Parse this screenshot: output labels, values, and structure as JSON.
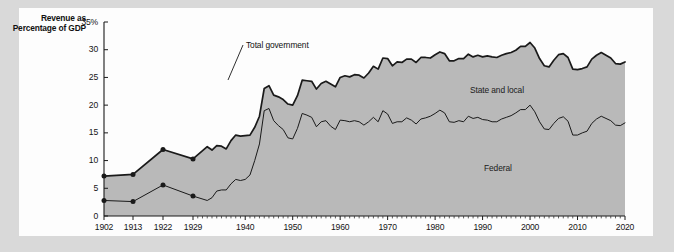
{
  "figure": {
    "panel_bg": "#fdfdfd",
    "outer_bg": "#d9d9d9",
    "area_fill": "#b9b9b9",
    "line_color": "#1a1a1a"
  },
  "axis_title": "Revenue as Percentage of GDP",
  "labels": {
    "total_government": "Total government",
    "state_and_local": "State and local",
    "federal": "Federal"
  },
  "chart_data": {
    "type": "area",
    "title": "Revenue as Percentage of GDP",
    "xlabel": "",
    "ylabel": "Revenue as Percentage of GDP",
    "ylim": [
      0,
      35
    ],
    "xlim": [
      1902,
      2020
    ],
    "grid": false,
    "legend": "inline-annotations",
    "ytick_labels": [
      "0",
      "5",
      "10",
      "15",
      "20",
      "25",
      "30",
      "35%"
    ],
    "ytick_values": [
      0,
      5,
      10,
      15,
      20,
      25,
      30,
      35
    ],
    "xtick_labels": [
      "1902",
      "1913",
      "1922",
      "1929",
      "1940",
      "1950",
      "1960",
      "1970",
      "1980",
      "1990",
      "2000",
      "2010",
      "2020"
    ],
    "xtick_values": [
      1902,
      1913,
      1922,
      1929,
      1940,
      1950,
      1960,
      1970,
      1980,
      1990,
      2000,
      2010,
      2020
    ],
    "annotations": [
      {
        "text": "Total government",
        "x": 1948,
        "y": 32.5
      },
      {
        "text": "State and local",
        "x": 1984,
        "y": 25.0
      },
      {
        "text": "Federal",
        "x": 1986,
        "y": 9.0
      }
    ],
    "marker_years": [
      1902,
      1913,
      1922,
      1929
    ],
    "series": [
      {
        "name": "Federal",
        "stacked": "bottom",
        "x": [
          1902,
          1913,
          1922,
          1929,
          1932,
          1933,
          1934,
          1935,
          1936,
          1937,
          1938,
          1939,
          1940,
          1941,
          1942,
          1943,
          1944,
          1945,
          1946,
          1947,
          1948,
          1949,
          1950,
          1951,
          1952,
          1953,
          1954,
          1955,
          1956,
          1957,
          1958,
          1959,
          1960,
          1961,
          1962,
          1963,
          1964,
          1965,
          1966,
          1967,
          1968,
          1969,
          1970,
          1971,
          1972,
          1973,
          1974,
          1975,
          1976,
          1977,
          1978,
          1979,
          1980,
          1981,
          1982,
          1983,
          1984,
          1985,
          1986,
          1987,
          1988,
          1989,
          1990,
          1991,
          1992,
          1993,
          1994,
          1995,
          1996,
          1997,
          1998,
          1999,
          2000,
          2001,
          2002,
          2003,
          2004,
          2005,
          2006,
          2007,
          2008,
          2009,
          2010,
          2011,
          2012,
          2013,
          2014,
          2015,
          2016,
          2017,
          2018,
          2019,
          2020
        ],
        "values": [
          2.8,
          2.6,
          5.6,
          3.6,
          2.8,
          3.3,
          4.5,
          4.7,
          4.7,
          5.8,
          6.6,
          6.4,
          6.6,
          7.4,
          10.0,
          13.0,
          19.0,
          19.4,
          17.2,
          16.3,
          15.6,
          14.1,
          13.9,
          15.8,
          18.5,
          18.2,
          17.8,
          16.1,
          17.0,
          17.2,
          16.2,
          15.6,
          17.3,
          17.2,
          17.0,
          17.2,
          17.0,
          16.4,
          17.0,
          17.8,
          17.0,
          19.0,
          18.4,
          16.7,
          17.0,
          17.0,
          17.7,
          17.3,
          16.6,
          17.5,
          17.7,
          18.0,
          18.5,
          19.1,
          18.6,
          17.0,
          16.9,
          17.2,
          17.0,
          18.0,
          17.6,
          17.8,
          17.4,
          17.3,
          17.0,
          17.0,
          17.5,
          17.8,
          18.1,
          18.6,
          19.2,
          19.2,
          20.0,
          18.8,
          17.0,
          15.7,
          15.6,
          16.7,
          17.6,
          17.9,
          17.1,
          14.6,
          14.6,
          15.0,
          15.3,
          16.7,
          17.5,
          18.0,
          17.6,
          17.2,
          16.4,
          16.3,
          16.8
        ]
      },
      {
        "name": "State and local",
        "stacked": "top",
        "x": [
          1902,
          1913,
          1922,
          1929,
          1932,
          1933,
          1934,
          1935,
          1936,
          1937,
          1938,
          1939,
          1940,
          1941,
          1942,
          1943,
          1944,
          1945,
          1946,
          1947,
          1948,
          1949,
          1950,
          1951,
          1952,
          1953,
          1954,
          1955,
          1956,
          1957,
          1958,
          1959,
          1960,
          1961,
          1962,
          1963,
          1964,
          1965,
          1966,
          1967,
          1968,
          1969,
          1970,
          1971,
          1972,
          1973,
          1974,
          1975,
          1976,
          1977,
          1978,
          1979,
          1980,
          1981,
          1982,
          1983,
          1984,
          1985,
          1986,
          1987,
          1988,
          1989,
          1990,
          1991,
          1992,
          1993,
          1994,
          1995,
          1996,
          1997,
          1998,
          1999,
          2000,
          2001,
          2002,
          2003,
          2004,
          2005,
          2006,
          2007,
          2008,
          2009,
          2010,
          2011,
          2012,
          2013,
          2014,
          2015,
          2016,
          2017,
          2018,
          2019,
          2020
        ],
        "values": [
          4.4,
          4.9,
          6.4,
          6.7,
          9.7,
          8.6,
          8.2,
          7.9,
          7.4,
          7.8,
          8.0,
          8.0,
          7.9,
          7.2,
          6.0,
          5.0,
          4.0,
          4.1,
          4.6,
          5.2,
          5.4,
          6.1,
          6.1,
          5.9,
          6.0,
          6.2,
          6.5,
          6.8,
          6.9,
          7.1,
          7.6,
          7.7,
          7.7,
          8.1,
          8.1,
          8.3,
          8.4,
          8.5,
          8.8,
          9.2,
          9.5,
          9.5,
          10.0,
          10.4,
          10.8,
          10.7,
          10.6,
          11.0,
          11.1,
          11.1,
          10.9,
          10.5,
          10.6,
          10.5,
          10.7,
          11.0,
          11.1,
          11.2,
          11.4,
          11.2,
          11.1,
          11.2,
          11.3,
          11.6,
          11.7,
          11.6,
          11.5,
          11.5,
          11.4,
          11.3,
          11.4,
          11.4,
          11.3,
          11.5,
          11.4,
          11.4,
          11.3,
          11.4,
          11.5,
          11.4,
          11.5,
          11.9,
          11.8,
          11.6,
          11.6,
          11.6,
          11.5,
          11.5,
          11.4,
          11.3,
          11.1,
          11.1,
          11.0
        ]
      }
    ],
    "total_government_note": "Top boundary of the stacked areas equals Federal + State and local."
  }
}
